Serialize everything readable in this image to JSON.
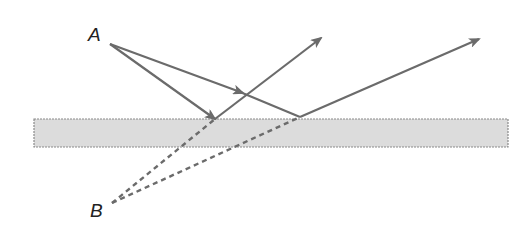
{
  "diagram": {
    "title": "",
    "labels": {
      "source": "A",
      "image": "B"
    },
    "colors": {
      "ray": "#6b6b6b",
      "virtual_ray": "#6b6b6b",
      "slab_fill": "#dcdcdc",
      "slab_border": "#8a8a8a",
      "label": "#222222"
    },
    "elements": {
      "slab": {
        "x": 34,
        "y": 119,
        "width": 474,
        "height": 28
      },
      "point_A": {
        "x": 110,
        "y": 44
      },
      "point_B": {
        "x": 112,
        "y": 203
      },
      "reflection_points": [
        {
          "x": 215,
          "y": 119
        },
        {
          "x": 300,
          "y": 117
        }
      ],
      "reflected_ray_ends": [
        {
          "x": 321,
          "y": 38
        },
        {
          "x": 479,
          "y": 39
        }
      ]
    }
  }
}
